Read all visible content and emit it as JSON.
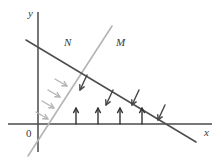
{
  "figure": {
    "type": "geometry-diagram",
    "width": 221,
    "height": 162,
    "background_color": "#ffffff",
    "axes": {
      "x_axis": {
        "label": "x",
        "color": "#4a4a4a",
        "y_pixel": 124,
        "x_start": 8,
        "x_end": 212,
        "label_x": 204,
        "label_y": 136
      },
      "y_axis": {
        "label": "y",
        "color": "#4a4a4a",
        "x_pixel": 38,
        "y_start": 12,
        "y_end": 152,
        "label_x": 28,
        "label_y": 17
      },
      "origin": {
        "label": "0",
        "label_x": 26,
        "label_y": 137
      }
    },
    "lines": [
      {
        "id": "line-M",
        "label": "M",
        "color": "#b4b4b4",
        "stroke_width": 1.6,
        "x1": 28,
        "y1": 156,
        "x2": 112,
        "y2": 26,
        "label_x": 116,
        "label_y": 46,
        "slope_direction": "rising-to-the-right",
        "arrow_color": "#b4b4b4",
        "arrow_direction": "perpendicular-right-down"
      },
      {
        "id": "line-N",
        "label": "N",
        "color": "#4f4f4f",
        "stroke_width": 1.6,
        "x1": 26,
        "y1": 40,
        "x2": 196,
        "y2": 142,
        "label_x": 64,
        "label_y": 46,
        "slope_direction": "falling-to-the-right",
        "arrow_color": "#444444",
        "arrow_direction": "perpendicular-down-left"
      }
    ],
    "arrow_groups": [
      {
        "id": "arrows-on-M",
        "name": "gray-arrows-perpendicular-to-M",
        "count": 4,
        "color": "#b4b4b4",
        "direction": "down-right",
        "arrows": [
          {
            "x1": 55,
            "y1": 79,
            "x2": 67,
            "y2": 86
          },
          {
            "x1": 48,
            "y1": 90,
            "x2": 60,
            "y2": 97
          },
          {
            "x1": 42,
            "y1": 101,
            "x2": 54,
            "y2": 108
          },
          {
            "x1": 36,
            "y1": 112,
            "x2": 48,
            "y2": 119
          }
        ]
      },
      {
        "id": "arrows-on-N",
        "name": "dark-arrows-perpendicular-to-N",
        "count": 4,
        "color": "#444444",
        "direction": "down-left",
        "arrows": [
          {
            "x1": 87,
            "y1": 75,
            "x2": 80,
            "y2": 90
          },
          {
            "x1": 113,
            "y1": 90,
            "x2": 106,
            "y2": 105
          },
          {
            "x1": 139,
            "y1": 90,
            "x2": 132,
            "y2": 105
          },
          {
            "x1": 165,
            "y1": 105,
            "x2": 158,
            "y2": 120
          }
        ]
      },
      {
        "id": "arrows-on-x-axis",
        "name": "dark-arrows-vertical-up",
        "count": 4,
        "color": "#333333",
        "direction": "up",
        "arrows": [
          {
            "x1": 76,
            "y1": 124,
            "x2": 76,
            "y2": 108
          },
          {
            "x1": 98,
            "y1": 124,
            "x2": 98,
            "y2": 108
          },
          {
            "x1": 120,
            "y1": 124,
            "x2": 120,
            "y2": 108
          },
          {
            "x1": 142,
            "y1": 124,
            "x2": 142,
            "y2": 108
          }
        ]
      }
    ]
  }
}
